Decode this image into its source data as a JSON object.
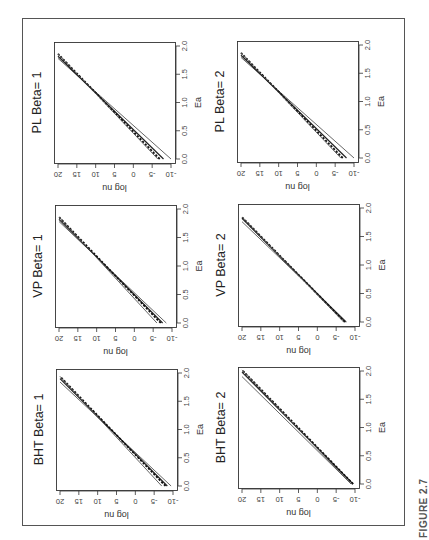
{
  "figure_label": "FIGURE 2.7",
  "chart_data": [
    {
      "type": "line",
      "title": "PL Beta= 1",
      "xlabel": "Ea",
      "ylabel": "log nu",
      "xlim": [
        0,
        2.0
      ],
      "ylim": [
        -10,
        20
      ],
      "xticks": [
        "0.0",
        "0.5",
        "1.0",
        "1.5",
        "2.0"
      ],
      "yticks": [
        "-10",
        "-5",
        "0",
        "5",
        "10",
        "15",
        "20"
      ],
      "series": [
        {
          "name": "lower bound",
          "style": "solid",
          "x": [
            0.0,
            1.78
          ],
          "y": [
            -10.0,
            20.0
          ]
        },
        {
          "name": "estimate",
          "style": "solid-dark",
          "x": [
            0.0,
            1.82
          ],
          "y": [
            -8.0,
            20.0
          ]
        },
        {
          "name": "mean",
          "style": "dashed",
          "x": [
            0.0,
            1.86
          ],
          "y": [
            -7.0,
            20.0
          ]
        },
        {
          "name": "upper bound",
          "style": "solid",
          "x": [
            0.0,
            1.86
          ],
          "y": [
            -6.5,
            20.0
          ]
        }
      ]
    },
    {
      "type": "line",
      "title": "VP Beta= 1",
      "xlabel": "Ea",
      "ylabel": "log nu",
      "xlim": [
        0,
        2.0
      ],
      "ylim": [
        -10,
        20
      ],
      "xticks": [
        "0.0",
        "0.5",
        "1.0",
        "1.5",
        "2.0"
      ],
      "yticks": [
        "-10",
        "-5",
        "0",
        "5",
        "10",
        "15",
        "20"
      ],
      "series": [
        {
          "name": "lower bound",
          "style": "solid",
          "x": [
            0.0,
            1.78
          ],
          "y": [
            -8.5,
            20.0
          ]
        },
        {
          "name": "estimate",
          "style": "solid-dark",
          "x": [
            0.0,
            1.82
          ],
          "y": [
            -7.5,
            20.0
          ]
        },
        {
          "name": "mean",
          "style": "dashed",
          "x": [
            0.0,
            1.86
          ],
          "y": [
            -7.0,
            20.0
          ]
        },
        {
          "name": "upper bound",
          "style": "solid",
          "x": [
            0.0,
            1.86
          ],
          "y": [
            -6.0,
            20.0
          ]
        }
      ]
    },
    {
      "type": "line",
      "title": "BHT Beta= 1",
      "xlabel": "Ea",
      "ylabel": "log nu",
      "xlim": [
        0,
        2.0
      ],
      "ylim": [
        -10,
        20
      ],
      "xticks": [
        "0.0",
        "0.5",
        "1.0",
        "1.5",
        "2.0"
      ],
      "yticks": [
        "-10",
        "-5",
        "0",
        "5",
        "10",
        "15",
        "20"
      ],
      "series": [
        {
          "name": "lower bound",
          "style": "solid",
          "x": [
            0.0,
            1.84
          ],
          "y": [
            -9.5,
            20.0
          ]
        },
        {
          "name": "estimate",
          "style": "solid-dark",
          "x": [
            0.0,
            1.9
          ],
          "y": [
            -8.5,
            20.0
          ]
        },
        {
          "name": "mean",
          "style": "dashed",
          "x": [
            0.0,
            1.94
          ],
          "y": [
            -8.0,
            20.0
          ]
        },
        {
          "name": "upper bound",
          "style": "solid",
          "x": [
            0.0,
            1.94
          ],
          "y": [
            -7.0,
            20.0
          ]
        }
      ]
    },
    {
      "type": "line",
      "title": "PL Beta= 2",
      "xlabel": "Ea",
      "ylabel": "log nu",
      "xlim": [
        0,
        2.0
      ],
      "ylim": [
        -10,
        20
      ],
      "xticks": [
        "0.0",
        "0.5",
        "1.0",
        "1.5",
        "2.0"
      ],
      "yticks": [
        "-10",
        "-5",
        "0",
        "5",
        "10",
        "15",
        "20"
      ],
      "series": [
        {
          "name": "lower bound",
          "style": "solid",
          "x": [
            0.0,
            1.78
          ],
          "y": [
            -10.0,
            20.0
          ]
        },
        {
          "name": "estimate",
          "style": "solid-dark",
          "x": [
            0.0,
            1.82
          ],
          "y": [
            -8.0,
            20.0
          ]
        },
        {
          "name": "mean",
          "style": "dashed",
          "x": [
            0.0,
            1.86
          ],
          "y": [
            -7.0,
            20.0
          ]
        },
        {
          "name": "upper bound",
          "style": "solid",
          "x": [
            0.0,
            1.86
          ],
          "y": [
            -6.5,
            20.0
          ]
        }
      ]
    },
    {
      "type": "line",
      "title": "VP Beta= 2",
      "xlabel": "Ea",
      "ylabel": "log nu",
      "xlim": [
        0,
        2.0
      ],
      "ylim": [
        -10,
        20
      ],
      "xticks": [
        "0.0",
        "0.5",
        "1.0",
        "1.5",
        "2.0"
      ],
      "yticks": [
        "-10",
        "-5",
        "0",
        "5",
        "10",
        "15",
        "20"
      ],
      "series": [
        {
          "name": "lower bound",
          "style": "solid",
          "x": [
            0.0,
            1.76
          ],
          "y": [
            -7.8,
            20.0
          ]
        },
        {
          "name": "estimate",
          "style": "solid-dark",
          "x": [
            0.0,
            1.82
          ],
          "y": [
            -7.5,
            20.0
          ]
        },
        {
          "name": "mean",
          "style": "dashed",
          "x": [
            0.0,
            1.84
          ],
          "y": [
            -7.3,
            20.0
          ]
        },
        {
          "name": "upper bound",
          "style": "solid",
          "x": [
            0.0,
            1.84
          ],
          "y": [
            -7.0,
            20.0
          ]
        }
      ]
    },
    {
      "type": "line",
      "title": "BHT Beta= 2",
      "xlabel": "Ea",
      "ylabel": "log nu",
      "xlim": [
        0,
        2.0
      ],
      "ylim": [
        -10,
        20
      ],
      "xticks": [
        "0.0",
        "0.5",
        "1.0",
        "1.5",
        "2.0"
      ],
      "yticks": [
        "-10",
        "-5",
        "0",
        "5",
        "10",
        "15",
        "20"
      ],
      "series": [
        {
          "name": "lower bound",
          "style": "solid",
          "x": [
            0.0,
            1.9
          ],
          "y": [
            -9.0,
            20.0
          ]
        },
        {
          "name": "estimate",
          "style": "solid-dark",
          "x": [
            0.0,
            1.98
          ],
          "y": [
            -9.5,
            20.0
          ]
        },
        {
          "name": "mean",
          "style": "dashed",
          "x": [
            0.0,
            2.02
          ],
          "y": [
            -9.5,
            20.0
          ]
        },
        {
          "name": "upper bound",
          "style": "solid",
          "x": [
            0.0,
            2.02
          ],
          "y": [
            -9.0,
            20.0
          ]
        }
      ]
    }
  ]
}
